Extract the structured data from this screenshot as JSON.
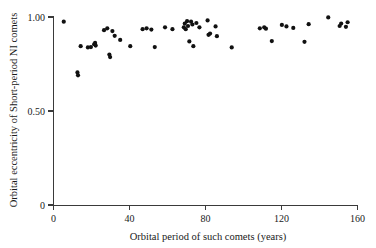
{
  "chart_data": {
    "type": "scatter",
    "title": "",
    "subtitle": "",
    "xlabel": "Orbital period of such comets (years)",
    "ylabel": "Orbital eccentricity of Short-period NI comets",
    "xlim": [
      0,
      160
    ],
    "ylim": [
      0,
      1.0
    ],
    "xticks": [
      0,
      40,
      80,
      120,
      160
    ],
    "xtick_labels": [
      "0",
      "40",
      "80",
      "120",
      "160"
    ],
    "yticks": [
      0,
      0.5,
      1.0
    ],
    "ytick_labels": [
      "0",
      "0.50",
      "1.00"
    ],
    "grid": false,
    "legend": false,
    "legend_position": "none",
    "marker": "filled-circle",
    "marker_color": "#111111",
    "marker_size_px": 2.1,
    "series": [
      {
        "name": "Short-period NI comets",
        "points": [
          [
            5.4,
            0.975
          ],
          [
            12.6,
            0.705
          ],
          [
            12.9,
            0.69
          ],
          [
            14.3,
            0.845
          ],
          [
            18.1,
            0.838
          ],
          [
            19.7,
            0.84
          ],
          [
            21.4,
            0.855
          ],
          [
            21.9,
            0.862
          ],
          [
            22.2,
            0.848
          ],
          [
            26.6,
            0.93
          ],
          [
            28.3,
            0.94
          ],
          [
            29.4,
            0.8
          ],
          [
            29.8,
            0.787
          ],
          [
            31.0,
            0.925
          ],
          [
            32.2,
            0.9
          ],
          [
            35.1,
            0.878
          ],
          [
            40.4,
            0.845
          ],
          [
            46.9,
            0.935
          ],
          [
            49.0,
            0.94
          ],
          [
            51.5,
            0.933
          ],
          [
            53.3,
            0.84
          ],
          [
            58.7,
            0.945
          ],
          [
            62.6,
            0.935
          ],
          [
            68.6,
            0.945
          ],
          [
            69.1,
            0.965
          ],
          [
            69.6,
            0.935
          ],
          [
            70.3,
            0.978
          ],
          [
            70.8,
            0.952
          ],
          [
            71.5,
            0.87
          ],
          [
            72.4,
            0.975
          ],
          [
            73.1,
            0.96
          ],
          [
            73.6,
            0.845
          ],
          [
            75.2,
            0.968
          ],
          [
            76.8,
            0.945
          ],
          [
            81.1,
            0.982
          ],
          [
            81.6,
            0.905
          ],
          [
            82.4,
            0.912
          ],
          [
            85.3,
            0.95
          ],
          [
            86.0,
            0.898
          ],
          [
            93.8,
            0.838
          ],
          [
            108.6,
            0.94
          ],
          [
            110.9,
            0.945
          ],
          [
            111.8,
            0.938
          ],
          [
            114.9,
            0.872
          ],
          [
            120.2,
            0.958
          ],
          [
            122.6,
            0.95
          ],
          [
            126.2,
            0.942
          ],
          [
            132.1,
            0.868
          ],
          [
            134.3,
            0.962
          ],
          [
            144.6,
            0.998
          ],
          [
            150.6,
            0.952
          ],
          [
            151.4,
            0.965
          ],
          [
            153.9,
            0.948
          ],
          [
            154.8,
            0.972
          ]
        ]
      }
    ]
  },
  "axes": {
    "x_title": "Orbital period of such comets (years)",
    "y_title": "Orbital eccentricity of Short-period NI comets",
    "x_tick_labels": [
      "0",
      "40",
      "80",
      "120",
      "160"
    ],
    "y_tick_labels": [
      "1.00",
      "0.50",
      "0"
    ]
  }
}
